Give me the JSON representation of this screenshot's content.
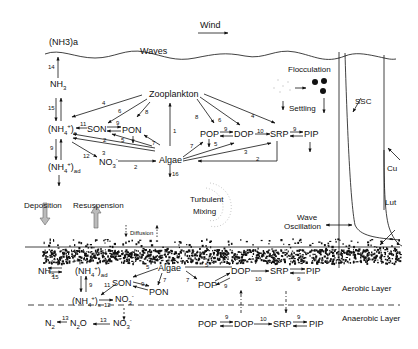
{
  "diagram": {
    "title_labels": {
      "nh3_atm": "(NH3)a",
      "waves": "Waves",
      "wind": "Wind",
      "flocculation": "Flocculation",
      "settling": "Settling",
      "ssc": "SSC",
      "current": "Cu",
      "lutocline": "Lut",
      "turbulent": "Turbulent",
      "mixing": "Mixing",
      "wave": "Wave",
      "oscillation": "Oscillation",
      "deposition": "Deposition",
      "resuspension": "Resuspension",
      "diffusion": "Diffusion",
      "aerobic_layer": "Aerobic Layer",
      "anaerobic_layer": "Anaerobic Layer"
    },
    "water_column": {
      "nodes": {
        "nh3": "NH3",
        "nh4s": "(NH4+)s",
        "nh4ad": "(NH4+)ad",
        "son": "SON",
        "pon": "PON",
        "no3": "NO3-",
        "zooplankton": "Zooplankton",
        "algae": "Algae",
        "pop": "POP",
        "dop": "DOP",
        "srp": "SRP",
        "pip": "PIP"
      },
      "process_numbers": {
        "atm_exchange": "14",
        "nh3_nh4": "15",
        "nh4_adsorption": "9",
        "zoo_nh4": "4",
        "zoo_son": "6",
        "zoo_pon": "8",
        "algae_zoo": "1",
        "son_nh4": "11",
        "son_pon": "9",
        "algae_nh4": "2",
        "algae_pon": "5",
        "nh4_no3": "12",
        "algae_no3": "3",
        "no3_algae": "2",
        "algae_pon7": "7",
        "algae_loss": "16",
        "zoo_pop": "8",
        "zoo_dop": "6",
        "zoo_srp": "4",
        "pop_dop": "9",
        "dop_srp": "10",
        "srp_pip": "9",
        "algae_pop": "7",
        "algae_dop": "5",
        "algae_srp": "3",
        "srp_algae": "2"
      }
    },
    "sediment_aerobic": {
      "nodes": {
        "nh3": "NH3",
        "nh4ad": "(NH4+)ad",
        "son": "SON",
        "algae": "Algae",
        "pon": "PON",
        "nh4s": "(NH4+)s",
        "no3": "NO3-",
        "pop": "POP",
        "dop": "DOP",
        "srp": "SRP",
        "pip": "PIP"
      },
      "process_numbers": {
        "nh3_nh4": "15",
        "nh4_ads": "9",
        "algae_son": "5",
        "algae_pon": "7",
        "son_pon": "9",
        "son_nh4": "11",
        "nh4_no3": "12",
        "algae_dop": "5",
        "algae_pop": "7",
        "pop_dop": "9",
        "dop_srp": "10",
        "srp_pip": "9"
      }
    },
    "sediment_anaerobic": {
      "nodes": {
        "n2": "N2",
        "n2o": "N2O",
        "no3": "NO3-",
        "pop": "POP",
        "dop": "DOP",
        "srp": "SRP",
        "pip": "PIP"
      },
      "process_numbers": {
        "n2o_n2": "13",
        "no3_n2o": "13",
        "pop_dop": "9",
        "dop_srp": "10",
        "srp_pip": "9"
      }
    }
  }
}
